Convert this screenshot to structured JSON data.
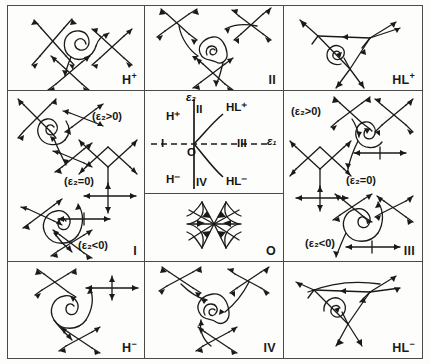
{
  "figure": {
    "background_color": "#fdfdfc",
    "ink_color": "#1a1a1a",
    "frame_color": "#4a4a4a",
    "grid": {
      "columns": 3,
      "rows": 3
    }
  },
  "cells": {
    "top_left": {
      "label_html": "H<sup>+</sup>",
      "label_text": "H+",
      "name": "phase-portrait-h-plus"
    },
    "top_center": {
      "label_html": "II",
      "label_text": "II",
      "name": "phase-portrait-region-ii"
    },
    "top_right": {
      "label_html": "HL<sup>+</sup>",
      "label_text": "HL+",
      "name": "phase-portrait-hl-plus"
    },
    "mid_left": {
      "label_html": "I",
      "label_text": "I",
      "name": "phase-portrait-region-i"
    },
    "mid_right": {
      "label_html": "III",
      "label_text": "III",
      "name": "phase-portrait-region-iii"
    },
    "center_top": {
      "label_html": "",
      "label_text": "",
      "name": "bifurcation-diagram"
    },
    "center_bottom": {
      "label_html": "O",
      "label_text": "O",
      "name": "phase-portrait-origin"
    },
    "bottom_left": {
      "label_html": "H<sup>−</sup>",
      "label_text": "H-",
      "name": "phase-portrait-h-minus"
    },
    "bottom_center": {
      "label_html": "IV",
      "label_text": "IV",
      "name": "phase-portrait-region-iv"
    },
    "bottom_right": {
      "label_html": "HL<sup>−</sup>",
      "label_text": "HL-",
      "name": "phase-portrait-hl-minus"
    }
  },
  "epsilon_notes": {
    "positive": "(ε₂>0)",
    "zero": "(ε₂=0)",
    "negative": "(ε₂<0)"
  },
  "bifurcation": {
    "axis_vertical": "ε₂",
    "axis_horizontal": "ε₁",
    "origin": "O",
    "region_left": "I",
    "region_right": "III",
    "region_upper_strip": "II",
    "region_lower_strip": "IV",
    "branch_upper_left": "H⁺",
    "branch_upper_right": "HL⁺",
    "branch_lower_left": "H⁻",
    "branch_lower_right": "HL⁻"
  }
}
